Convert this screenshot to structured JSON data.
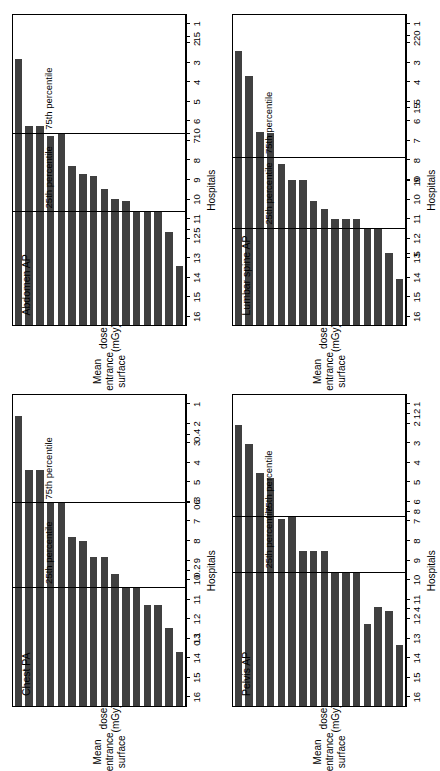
{
  "figure": {
    "orientation": "rotated-90-ccw",
    "layout": "2x2 grid of horizontal bar panels",
    "bar_color": "#404040",
    "axis_color": "#000000",
    "background": "#ffffff"
  },
  "common": {
    "ylabel_line1": "Mean entrance surface",
    "ylabel_line2": "dose (mGy)",
    "xlabel": "Hospitals",
    "ref_label_75": "75th percentile",
    "ref_label_25": "25th percentile"
  },
  "chart_data": [
    {
      "type": "bar",
      "title": "Chest PA",
      "xlabel": "Hospitals",
      "ylabel": "Mean entrance surface dose (mGy)",
      "categories": [
        "1",
        "2",
        "3",
        "4",
        "5",
        "6",
        "7",
        "8",
        "9",
        "10",
        "11",
        "12",
        "13",
        "14",
        "15",
        "16"
      ],
      "values": [
        0.08,
        0.115,
        0.15,
        0.15,
        0.175,
        0.175,
        0.195,
        0.22,
        0.22,
        0.245,
        0.25,
        0.3,
        0.3,
        0.35,
        0.35,
        0.43
      ],
      "ylim": [
        0,
        0.46
      ],
      "yticks": [
        0.1,
        0.2,
        0.3,
        0.4
      ],
      "ytick_labels": [
        "0.1",
        "0.2",
        "0.3",
        "0.4"
      ],
      "reference_lines": [
        {
          "label": "25th percentile",
          "value": 0.175
        },
        {
          "label": "75th percentile",
          "value": 0.3
        }
      ],
      "grid": false,
      "legend": "none"
    },
    {
      "type": "bar",
      "title": "Abdomen AP",
      "xlabel": "Hospitals",
      "ylabel": "Mean entrance surface dose (mGy)",
      "categories": [
        "1",
        "2",
        "3",
        "4",
        "5",
        "6",
        "7",
        "8",
        "9",
        "10",
        "11",
        "12",
        "13",
        "14",
        "15",
        "16"
      ],
      "values": [
        3.1,
        4.9,
        5.9,
        5.9,
        5.9,
        6.5,
        6.6,
        7.1,
        7.8,
        7.9,
        8.3,
        10.0,
        9.9,
        10.4,
        10.4,
        13.9
      ],
      "ylim": [
        0,
        16.2
      ],
      "yticks": [
        5,
        10,
        15
      ],
      "ytick_labels": [
        "5",
        "10",
        "15"
      ],
      "reference_lines": [
        {
          "label": "25th percentile",
          "value": 5.9
        },
        {
          "label": "75th percentile",
          "value": 10.0
        }
      ],
      "grid": false,
      "legend": "none"
    },
    {
      "type": "bar",
      "title": "Pelvis AP",
      "xlabel": "Hospitals",
      "ylabel": "Mean entrance surface dose (mGy)",
      "categories": [
        "1",
        "2",
        "3",
        "4",
        "5",
        "6",
        "7",
        "8",
        "9",
        "10",
        "11",
        "12",
        "13",
        "14",
        "15",
        "16"
      ],
      "values": [
        2.5,
        3.9,
        4.1,
        3.4,
        5.5,
        5.5,
        5.5,
        6.4,
        6.4,
        6.4,
        7.8,
        7.7,
        9.4,
        9.6,
        10.8,
        11.6
      ],
      "ylim": [
        0,
        12.8
      ],
      "yticks": [
        4,
        8,
        12
      ],
      "ytick_labels": [
        "4",
        "8",
        "12"
      ],
      "reference_lines": [
        {
          "label": "25th percentile",
          "value": 5.5
        },
        {
          "label": "75th percentile",
          "value": 7.8
        }
      ],
      "grid": false,
      "legend": "none"
    },
    {
      "type": "bar",
      "title": "Lumbar spine AP",
      "xlabel": "Hospitals",
      "ylabel": "Mean entrance surface dose (mGy)",
      "categories": [
        "1",
        "2",
        "3",
        "4",
        "5",
        "6",
        "7",
        "8",
        "9",
        "10",
        "11",
        "12",
        "13",
        "14",
        "15",
        "16"
      ],
      "values": [
        3.2,
        5.0,
        6.7,
        6.7,
        7.4,
        7.4,
        7.4,
        8.1,
        8.6,
        10.1,
        10.1,
        11.2,
        13.3,
        13.4,
        17.3,
        19.0
      ],
      "ylim": [
        0,
        21.5
      ],
      "yticks": [
        5,
        10,
        15,
        20
      ],
      "ytick_labels": [
        "5",
        "10",
        "15",
        "20"
      ],
      "reference_lines": [
        {
          "label": "25th percentile",
          "value": 6.7
        },
        {
          "label": "75th percentile",
          "value": 11.6
        }
      ],
      "grid": false,
      "legend": "none"
    }
  ]
}
